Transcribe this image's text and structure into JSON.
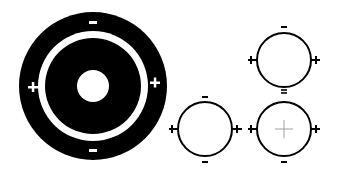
{
  "diagram": {
    "background": "#ffffff",
    "foreground": "#000000",
    "large_target": {
      "center": [
        93,
        86
      ],
      "outer_radius": 74,
      "ring_outer_radius": 55,
      "ring_inner_radius": 48,
      "center_hole_radius": 16,
      "signs": {
        "top": "−",
        "bottom": "−",
        "left": "+",
        "right": "+"
      }
    },
    "small_circles": [
      {
        "id": "top-right",
        "center": [
          284,
          60
        ],
        "radius": 27,
        "signs": {
          "top": "−",
          "bottom": "=",
          "left": "+",
          "right": "+"
        },
        "center_cross": false
      },
      {
        "id": "bottom-left",
        "center": [
          205,
          129
        ],
        "radius": 27,
        "signs": {
          "top": "−",
          "bottom": "−",
          "left": "+",
          "right": "+"
        },
        "center_cross": false
      },
      {
        "id": "bottom-right",
        "center": [
          284,
          129
        ],
        "radius": 27,
        "signs": {
          "top": "=",
          "bottom": "−",
          "left": "+",
          "right": "+"
        },
        "center_cross": true
      }
    ]
  }
}
